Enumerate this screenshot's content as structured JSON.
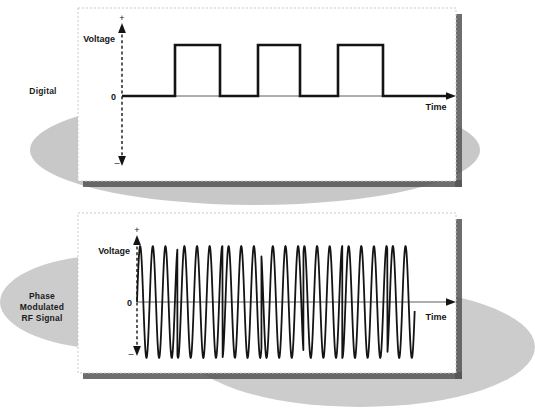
{
  "figure": {
    "title_present": false,
    "background": "#ffffff",
    "ink": "#141414",
    "ellipse_fill": "#b9b9b9",
    "shadow_fill": "#6e6e6e",
    "panel_fill": "#ffffff",
    "panel_border": "#bdbdbd"
  },
  "panels": [
    {
      "id": "digital",
      "label": "Digital",
      "label_lines": [
        "Digital"
      ],
      "axes": {
        "y_label": "Voltage",
        "y_plus": "+",
        "y_minus": "–",
        "zero_label": "0",
        "x_label": "Time"
      }
    },
    {
      "id": "phase-modulated-rf",
      "label": "Phase Modulated RF Signal",
      "label_lines": [
        "Phase",
        "Modulated",
        "RF Signal"
      ],
      "axes": {
        "y_label": "Voltage",
        "y_plus": "+",
        "y_minus": "–",
        "zero_label": "0",
        "x_label": "Time"
      }
    }
  ],
  "chart_data": [
    {
      "type": "line",
      "id": "digital-square-wave",
      "title": "Digital",
      "xlabel": "Time",
      "ylabel": "Voltage",
      "ylim": [
        -1,
        1
      ],
      "xlim": [
        0,
        100
      ],
      "grid": false,
      "legend": null,
      "annotations": [
        "+",
        "0",
        "–"
      ],
      "description": "Unipolar binary square wave, three positive pulses at logic 1, baseline at 0",
      "bit_sequence": [
        0,
        1,
        0,
        1,
        0,
        1,
        0
      ],
      "levels": {
        "low": 0,
        "high": 1
      },
      "x": [
        0,
        12.5,
        12.5,
        26.5,
        26.5,
        38.5,
        38.5,
        51.5,
        51.5,
        63.5,
        63.5,
        77.5,
        77.5,
        100
      ],
      "y": [
        0,
        0,
        1,
        1,
        0,
        0,
        1,
        1,
        0,
        0,
        1,
        1,
        0,
        0
      ]
    },
    {
      "type": "line",
      "id": "phase-modulated-rf-signal",
      "title": "Phase Modulated RF Signal",
      "xlabel": "Time",
      "ylabel": "Voltage",
      "ylim": [
        -1,
        1
      ],
      "xlim": [
        0,
        100
      ],
      "grid": false,
      "legend": null,
      "annotations": [
        "+",
        "0",
        "–"
      ],
      "description": "Constant-amplitude RF carrier whose phase reverses by 180 degrees at each digital bit transition",
      "carrier_cycles_total": 22,
      "amplitude": 1,
      "phase_shift_degrees": 180,
      "phase_segments": [
        {
          "x_start": 0.0,
          "x_end": 12.5,
          "phase_deg": 0
        },
        {
          "x_start": 12.5,
          "x_end": 26.5,
          "phase_deg": 180
        },
        {
          "x_start": 26.5,
          "x_end": 38.5,
          "phase_deg": 0
        },
        {
          "x_start": 38.5,
          "x_end": 51.5,
          "phase_deg": 180
        },
        {
          "x_start": 51.5,
          "x_end": 63.5,
          "phase_deg": 0
        },
        {
          "x_start": 63.5,
          "x_end": 77.5,
          "phase_deg": 180
        },
        {
          "x_start": 77.5,
          "x_end": 86.0,
          "phase_deg": 0
        }
      ]
    }
  ]
}
